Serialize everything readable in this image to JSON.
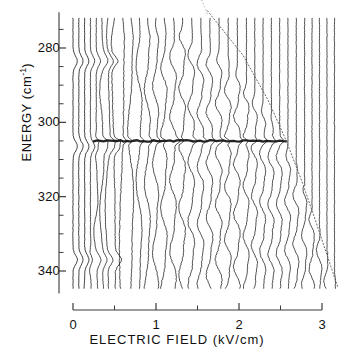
{
  "figure": {
    "kind": "stark-map-spectra",
    "background_color": "#ffffff",
    "trace_color": "#101010",
    "axis_color": "#3a3a3a",
    "limit_line_color": "#555555"
  },
  "axes": {
    "x": {
      "label": "ELECTRIC  FIELD  (kV/cm)",
      "unit": "kV/cm",
      "name": "ELECTRIC FIELD",
      "min": 0,
      "max": 3.2,
      "major_ticks": [
        0,
        1,
        2,
        3
      ],
      "minor_ticks": [
        0.5,
        1.5,
        2.5
      ],
      "tick_labels": [
        "0",
        "1",
        "2",
        "3"
      ],
      "pixel_min": 73,
      "pixel_max": 322,
      "grid": false
    },
    "y": {
      "label": "ENERGY  (cm",
      "label_sup": "-1",
      "label_tail": ")",
      "unit": "cm^-1",
      "name": "ENERGY",
      "min": 272,
      "max": 345,
      "inverted": true,
      "major_ticks": [
        280,
        300,
        320,
        340
      ],
      "minor_ticks": [
        275,
        285,
        290,
        295,
        305,
        310,
        315,
        325,
        330,
        335
      ],
      "tick_labels": [
        "280",
        "300",
        "320",
        "340"
      ],
      "pixel_at_280": 48,
      "pixel_at_340": 271,
      "grid": false
    }
  },
  "chart_data": {
    "type": "line",
    "title": "",
    "subtitle": "",
    "xlabel": "ELECTRIC  FIELD  (kV/cm)",
    "ylabel": "ENERGY  (cm-1)",
    "xlim": [
      0,
      3.2
    ],
    "ylim": [
      272,
      345
    ],
    "y_inverted": true,
    "grid": false,
    "legend": "none",
    "n_traces": 34,
    "trace_fields": [
      0.0,
      0.07,
      0.14,
      0.21,
      0.28,
      0.35,
      0.42,
      0.5,
      0.6,
      0.7,
      0.8,
      0.9,
      1.0,
      1.1,
      1.21,
      1.32,
      1.43,
      1.54,
      1.65,
      1.76,
      1.87,
      1.98,
      2.09,
      2.19,
      2.29,
      2.39,
      2.49,
      2.59,
      2.69,
      2.79,
      2.88,
      2.97,
      3.06,
      3.15
    ],
    "trace_oscillation_onset_energy": [
      345.0,
      345.0,
      340.0,
      330.0,
      300.0,
      276.0,
      272.0,
      272.0,
      272.0,
      272.0,
      272.0,
      272.0,
      272.0,
      272.0,
      272.0,
      272.0,
      273.5,
      275.5,
      277.5,
      279.5,
      282.0,
      284.5,
      287.5,
      290.5,
      294.0,
      297.5,
      301.5,
      305.5,
      310.0,
      315.0,
      320.5,
      326.5,
      333.0,
      340.0
    ],
    "annotations": [
      {
        "name": "classical-ionization-limit",
        "style": "dotted-diagonal",
        "description": "Dotted boundary marking the classical field-ionization limit; oscillatory structure exists only below/left of this line.",
        "points": [
          {
            "field": 1.62,
            "energy": 270.0
          },
          {
            "field": 2.05,
            "energy": 282.0
          },
          {
            "field": 2.35,
            "energy": 294.0
          },
          {
            "field": 2.57,
            "energy": 305.0
          },
          {
            "field": 2.76,
            "energy": 316.0
          },
          {
            "field": 2.93,
            "energy": 327.0
          },
          {
            "field": 3.08,
            "energy": 337.0
          },
          {
            "field": 3.2,
            "energy": 345.0
          }
        ]
      },
      {
        "name": "resonance-band",
        "style": "dark-horizontal-band",
        "energy": 305.0,
        "field_start": 0.25,
        "field_end": 2.58,
        "description": "Strong dark horizontal feature: a field-independent resonance near 305 cm-1 persisting across all traces up to the ionization limit."
      }
    ],
    "series": [
      {
        "name": "spectrum-at-0.00-kV/cm",
        "field": 0.0,
        "oscillatory": false
      },
      {
        "name": "spectrum-at-0.07-kV/cm",
        "field": 0.07,
        "oscillatory": false
      },
      {
        "name": "spectrum-at-0.14-kV/cm",
        "field": 0.14,
        "oscillatory": false
      },
      {
        "name": "spectrum-at-0.21-kV/cm",
        "field": 0.21,
        "oscillatory": true
      },
      {
        "name": "spectrum-at-0.28-kV/cm",
        "field": 0.28,
        "oscillatory": true
      },
      {
        "name": "spectrum-at-0.35-kV/cm",
        "field": 0.35,
        "oscillatory": true
      },
      {
        "name": "spectrum-at-0.42-kV/cm",
        "field": 0.42,
        "oscillatory": true
      },
      {
        "name": "spectrum-at-0.50-kV/cm",
        "field": 0.5,
        "oscillatory": true
      },
      {
        "name": "spectrum-at-0.60-kV/cm",
        "field": 0.6,
        "oscillatory": true
      },
      {
        "name": "spectrum-at-0.70-kV/cm",
        "field": 0.7,
        "oscillatory": true
      },
      {
        "name": "spectrum-at-0.80-kV/cm",
        "field": 0.8,
        "oscillatory": true
      },
      {
        "name": "spectrum-at-0.90-kV/cm",
        "field": 0.9,
        "oscillatory": true
      },
      {
        "name": "spectrum-at-1.00-kV/cm",
        "field": 1.0,
        "oscillatory": true
      },
      {
        "name": "spectrum-at-1.10-kV/cm",
        "field": 1.1,
        "oscillatory": true
      },
      {
        "name": "spectrum-at-1.21-kV/cm",
        "field": 1.21,
        "oscillatory": true
      },
      {
        "name": "spectrum-at-1.32-kV/cm",
        "field": 1.32,
        "oscillatory": true
      },
      {
        "name": "spectrum-at-1.43-kV/cm",
        "field": 1.43,
        "oscillatory": true
      },
      {
        "name": "spectrum-at-1.54-kV/cm",
        "field": 1.54,
        "oscillatory": true
      },
      {
        "name": "spectrum-at-1.65-kV/cm",
        "field": 1.65,
        "oscillatory": true
      },
      {
        "name": "spectrum-at-1.76-kV/cm",
        "field": 1.76,
        "oscillatory": true
      },
      {
        "name": "spectrum-at-1.87-kV/cm",
        "field": 1.87,
        "oscillatory": true
      },
      {
        "name": "spectrum-at-1.98-kV/cm",
        "field": 1.98,
        "oscillatory": true
      },
      {
        "name": "spectrum-at-2.09-kV/cm",
        "field": 2.09,
        "oscillatory": true
      },
      {
        "name": "spectrum-at-2.19-kV/cm",
        "field": 2.19,
        "oscillatory": true
      },
      {
        "name": "spectrum-at-2.29-kV/cm",
        "field": 2.29,
        "oscillatory": true
      },
      {
        "name": "spectrum-at-2.39-kV/cm",
        "field": 2.39,
        "oscillatory": true
      },
      {
        "name": "spectrum-at-2.49-kV/cm",
        "field": 2.49,
        "oscillatory": true
      },
      {
        "name": "spectrum-at-2.59-kV/cm",
        "field": 2.59,
        "oscillatory": true
      },
      {
        "name": "spectrum-at-2.69-kV/cm",
        "field": 2.69,
        "oscillatory": true
      },
      {
        "name": "spectrum-at-2.79-kV/cm",
        "field": 2.79,
        "oscillatory": true
      },
      {
        "name": "spectrum-at-2.88-kV/cm",
        "field": 2.88,
        "oscillatory": true
      },
      {
        "name": "spectrum-at-2.97-kV/cm",
        "field": 2.97,
        "oscillatory": true
      },
      {
        "name": "spectrum-at-3.06-kV/cm",
        "field": 3.06,
        "oscillatory": true
      },
      {
        "name": "spectrum-at-3.15-kV/cm",
        "field": 3.15,
        "oscillatory": true
      }
    ]
  }
}
